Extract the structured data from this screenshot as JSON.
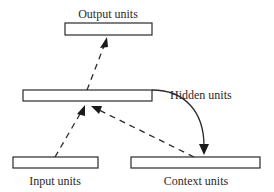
{
  "diagram": {
    "nodes": [
      {
        "id": "output",
        "label": "Output units"
      },
      {
        "id": "hidden",
        "label": "Hidden units"
      },
      {
        "id": "input",
        "label": "Input units"
      },
      {
        "id": "context",
        "label": "Context units"
      }
    ],
    "edges": [
      {
        "from": "input",
        "to": "hidden",
        "style": "dashed"
      },
      {
        "from": "context",
        "to": "hidden",
        "style": "dashed"
      },
      {
        "from": "hidden",
        "to": "output",
        "style": "dashed"
      },
      {
        "from": "hidden",
        "to": "context",
        "style": "solid-curved"
      }
    ],
    "colors": {
      "stroke": "#2a2a2a",
      "background": "#ffffff"
    }
  }
}
